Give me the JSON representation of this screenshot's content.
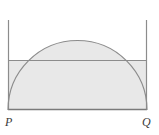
{
  "figure": {
    "labels": {
      "left_vertex": "P",
      "right_vertex": "Q"
    },
    "colors": {
      "stroke": "#8c8c8c",
      "stroke_dark": "#7a7a7a",
      "shade_fill": "#e8e8e8",
      "background": "#ffffff",
      "label_color": "#3a3a3a"
    },
    "geometry": {
      "rect_left_x": 8,
      "rect_right_x": 147,
      "rect_baseline_y": 110,
      "rect_top_y": 20,
      "chord_y": 60,
      "semicircle_center_x": 77.5,
      "semicircle_radius": 69.5,
      "semicircle_apex_y": 40.5,
      "stroke_width": 1.1
    },
    "shaded_regions": [
      "circular-segment-above-chord",
      "left-corner-below-chord-outside-arc",
      "right-corner-below-chord-outside-arc"
    ]
  }
}
